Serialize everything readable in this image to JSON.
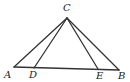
{
  "diagram": {
    "type": "geometry-triangle",
    "points": {
      "C": {
        "label": "C",
        "x": 67,
        "y": 18
      },
      "A": {
        "label": "A",
        "x": 14,
        "y": 67
      },
      "D": {
        "label": "D",
        "x": 34,
        "y": 68
      },
      "E": {
        "label": "E",
        "x": 98,
        "y": 69
      },
      "B": {
        "label": "B",
        "x": 119,
        "y": 70
      }
    },
    "segments": [
      [
        "C",
        "A"
      ],
      [
        "C",
        "D"
      ],
      [
        "C",
        "E"
      ],
      [
        "C",
        "B"
      ],
      [
        "A",
        "B"
      ]
    ],
    "labels": {
      "C": "C",
      "A": "A",
      "D": "D",
      "E": "E",
      "B": "B"
    }
  }
}
